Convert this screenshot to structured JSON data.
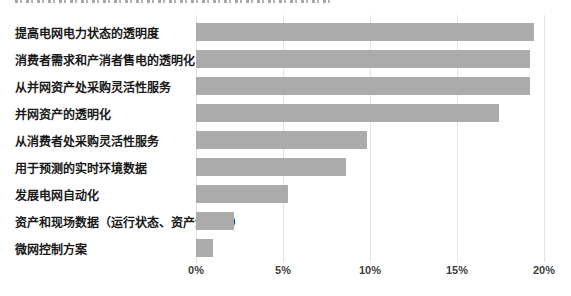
{
  "colors": {
    "background": "#ffffff",
    "bar": "#ababab",
    "gridline": "#e3e3e3",
    "category_label": "#1a1a1a",
    "tick_label": "#3d3d3d"
  },
  "chart_data": {
    "type": "bar",
    "orientation": "horizontal",
    "title": "",
    "xlabel": "",
    "ylabel": "",
    "categories": [
      "提高电网电力状态的透明度",
      "消费者需求和产消者售电的透明化",
      "从并网资产处采购灵活性服务",
      "并网资产的透明化",
      "从消费者处采购灵活性服务",
      "用于预测的实时环境数据",
      "发展电网自动化",
      "资产和现场数据（运行状态、资产温度等）",
      "微网控制方案"
    ],
    "values": [
      19.4,
      19.2,
      19.2,
      17.4,
      9.8,
      8.6,
      5.3,
      2.2,
      1.0
    ],
    "unit": "%",
    "xlim": [
      0,
      20
    ],
    "x_ticks": [
      "0%",
      "5%",
      "10%",
      "15%",
      "20%"
    ],
    "x_tick_values": [
      0,
      5,
      10,
      15,
      20
    ],
    "grid": "vertical",
    "legend": "none"
  }
}
